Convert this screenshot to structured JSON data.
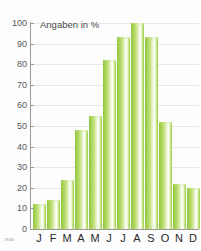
{
  "chart_data": {
    "type": "bar",
    "title": "Angaben in %",
    "xlabel": "",
    "ylabel": "",
    "ylim": [
      0,
      100
    ],
    "yticks": [
      0,
      10,
      20,
      30,
      40,
      50,
      60,
      70,
      80,
      90,
      100
    ],
    "grid": true,
    "legend": null,
    "categories": [
      "J",
      "F",
      "M",
      "A",
      "M",
      "J",
      "J",
      "A",
      "S",
      "O",
      "N",
      "D"
    ],
    "values": [
      12,
      14,
      24,
      48,
      55,
      82,
      93,
      100,
      93,
      52,
      22,
      20
    ],
    "bar_color": "#9ccd4d"
  },
  "credit": "29306",
  "colors": {
    "background": "#fdfdfd",
    "axis": "#9a9a9a",
    "grid": "#e8e8e8",
    "tick_text": "#58585a",
    "label_text": "#2a2a2a",
    "title_text": "#4a4a4a",
    "bar_green": "#8cc63f",
    "bar_highlight": "#ffffff"
  }
}
